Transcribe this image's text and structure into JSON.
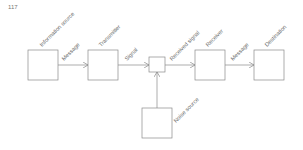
{
  "page_number": "117",
  "diagram": {
    "nodes": [
      {
        "id": "info_source",
        "label": "Information source"
      },
      {
        "id": "transmitter",
        "label": "Transmitter"
      },
      {
        "id": "channel",
        "label": ""
      },
      {
        "id": "receiver",
        "label": "Receiver"
      },
      {
        "id": "destination",
        "label": "Destination"
      },
      {
        "id": "noise_source",
        "label": "Noise source"
      }
    ],
    "edges": [
      {
        "from": "info_source",
        "to": "transmitter",
        "label": "Message"
      },
      {
        "from": "transmitter",
        "to": "channel",
        "label": "Signal"
      },
      {
        "from": "channel",
        "to": "receiver",
        "label": "Received signal"
      },
      {
        "from": "receiver",
        "to": "destination",
        "label": "Message"
      },
      {
        "from": "noise_source",
        "to": "channel",
        "label": ""
      }
    ]
  },
  "colors": {
    "stroke": "#8a8a8a",
    "text": "#666666"
  }
}
